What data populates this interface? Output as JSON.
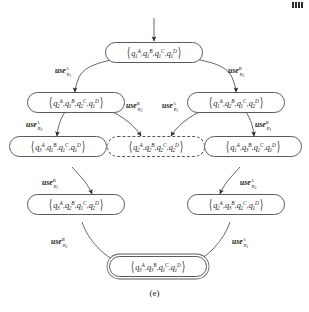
{
  "figure": {
    "caption": "(e)",
    "type": "state-transition-diagram",
    "corner_marks": 4
  },
  "nodes": [
    {
      "id": "n-top",
      "name": "state-node-initial",
      "style": "solid",
      "tuple": [
        {
          "q": "q",
          "sub": "1",
          "sup": "A"
        },
        {
          "q": "q",
          "sub": "1",
          "sup": "B"
        },
        {
          "q": "q",
          "sub": "1",
          "sup": "C"
        },
        {
          "q": "q",
          "sub": "1",
          "sup": "D"
        }
      ]
    },
    {
      "id": "n-l2",
      "name": "state-node-left-2",
      "style": "solid",
      "tuple": [
        {
          "q": "q",
          "sub": "2",
          "sup": "A"
        },
        {
          "q": "q",
          "sub": "1",
          "sup": "B"
        },
        {
          "q": "q",
          "sub": "2",
          "sup": "C"
        },
        {
          "q": "q",
          "sub": "1",
          "sup": "D"
        }
      ]
    },
    {
      "id": "n-r2",
      "name": "state-node-right-2",
      "style": "solid",
      "tuple": [
        {
          "q": "q",
          "sub": "1",
          "sup": "A"
        },
        {
          "q": "q",
          "sub": "2",
          "sup": "B"
        },
        {
          "q": "q",
          "sub": "1",
          "sup": "C"
        },
        {
          "q": "q",
          "sub": "2",
          "sup": "D"
        }
      ]
    },
    {
      "id": "n-l3",
      "name": "state-node-left-3",
      "style": "solid",
      "tuple": [
        {
          "q": "q",
          "sub": "3",
          "sup": "A"
        },
        {
          "q": "q",
          "sub": "1",
          "sup": "B"
        },
        {
          "q": "q",
          "sub": "1",
          "sup": "C"
        },
        {
          "q": "q",
          "sub": "1",
          "sup": "D"
        }
      ]
    },
    {
      "id": "n-mid",
      "name": "state-node-deadlock",
      "style": "dashed",
      "tuple": [
        {
          "q": "q",
          "sub": "2",
          "sup": "A"
        },
        {
          "q": "q",
          "sub": "2",
          "sup": "B"
        },
        {
          "q": "q",
          "sub": "2",
          "sup": "C"
        },
        {
          "q": "q",
          "sub": "2",
          "sup": "D"
        }
      ]
    },
    {
      "id": "n-r3",
      "name": "state-node-right-3",
      "style": "solid",
      "tuple": [
        {
          "q": "q",
          "sub": "1",
          "sup": "A"
        },
        {
          "q": "q",
          "sub": "3",
          "sup": "B"
        },
        {
          "q": "q",
          "sub": "1",
          "sup": "C"
        },
        {
          "q": "q",
          "sub": "1",
          "sup": "D"
        }
      ]
    },
    {
      "id": "n-l4",
      "name": "state-node-left-4",
      "style": "solid",
      "tuple": [
        {
          "q": "q",
          "sub": "3",
          "sup": "A"
        },
        {
          "q": "q",
          "sub": "2",
          "sup": "B"
        },
        {
          "q": "q",
          "sub": "1",
          "sup": "C"
        },
        {
          "q": "q",
          "sub": "2",
          "sup": "D"
        }
      ]
    },
    {
      "id": "n-r4",
      "name": "state-node-right-4",
      "style": "solid",
      "tuple": [
        {
          "q": "q",
          "sub": "2",
          "sup": "A"
        },
        {
          "q": "q",
          "sub": "3",
          "sup": "B"
        },
        {
          "q": "q",
          "sub": "2",
          "sup": "C"
        },
        {
          "q": "q",
          "sub": "1",
          "sup": "D"
        }
      ]
    },
    {
      "id": "n-bot",
      "name": "state-node-final",
      "style": "accepting",
      "tuple": [
        {
          "q": "q",
          "sub": "3",
          "sup": "A"
        },
        {
          "q": "q",
          "sub": "3",
          "sup": "B"
        },
        {
          "q": "q",
          "sub": "1",
          "sup": "C"
        },
        {
          "q": "q",
          "sub": "1",
          "sup": "D"
        }
      ]
    }
  ],
  "edge_labels": [
    {
      "id": "e1",
      "name": "edge-label-top-left",
      "word": "use",
      "sup": "A",
      "sub": "R",
      "subsub": "1"
    },
    {
      "id": "e2",
      "name": "edge-label-top-right",
      "word": "use",
      "sup": "B",
      "sub": "R",
      "subsub": "2"
    },
    {
      "id": "e3",
      "name": "edge-label-mid-left",
      "word": "use",
      "sup": "B",
      "sub": "R",
      "subsub": "2"
    },
    {
      "id": "e4",
      "name": "edge-label-mid-right",
      "word": "use",
      "sup": "A",
      "sub": "R",
      "subsub": "1"
    },
    {
      "id": "e5",
      "name": "edge-label-left-upper",
      "word": "use",
      "sup": "A",
      "sub": "R",
      "subsub": "2"
    },
    {
      "id": "e6",
      "name": "edge-label-right-upper",
      "word": "use",
      "sup": "B",
      "sub": "R",
      "subsub": "1"
    },
    {
      "id": "e7",
      "name": "edge-label-left-lower",
      "word": "use",
      "sup": "B",
      "sub": "R",
      "subsub": "1"
    },
    {
      "id": "e8",
      "name": "edge-label-right-lower",
      "word": "use",
      "sup": "A",
      "sub": "R",
      "subsub": "2"
    },
    {
      "id": "e9",
      "name": "edge-label-left-final",
      "word": "use",
      "sup": "B",
      "sub": "R",
      "subsub": "2"
    },
    {
      "id": "e10",
      "name": "edge-label-right-final",
      "word": "use",
      "sup": "A",
      "sub": "R",
      "subsub": "1"
    }
  ],
  "colors": {
    "stroke": "#5a5a5a",
    "text": "#1a1a1a",
    "background": "#ffffff"
  }
}
